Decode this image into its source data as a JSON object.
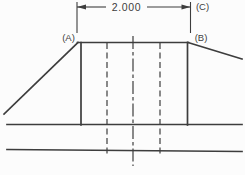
{
  "diagram": {
    "type": "technical-drawing-section-profile",
    "background_color": "#fcfcfc",
    "line_color": "#3d3d3d",
    "dimension": {
      "value": "2.000"
    },
    "labels": {
      "point_a": "(A)",
      "point_b": "(B)",
      "point_c": "(C)"
    }
  }
}
